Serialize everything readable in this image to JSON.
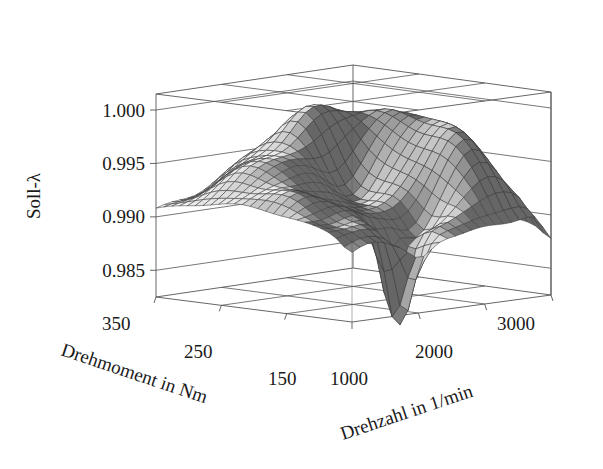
{
  "figure": {
    "background_color": "#ffffff",
    "line_color": "#555555",
    "text_color": "#1a1a1a"
  },
  "chart_data": {
    "type": "surface",
    "title": "",
    "projection": "3d-wireframe-surface",
    "shading": "grayscale-mesh",
    "grid": true,
    "legend": null,
    "zlabel": "Soll-λ",
    "xlabel": "Drehmoment in Nm",
    "ylabel": "Drehzahl in 1/min",
    "zticks": [
      "1.000",
      "0.995",
      "0.990",
      "0.985"
    ],
    "ztick_values": [
      1.0,
      0.995,
      0.99,
      0.985
    ],
    "zlim": [
      0.9825,
      1.0015
    ],
    "xticks": [
      "350",
      "250",
      "150"
    ],
    "xtick_values": [
      350,
      250,
      150
    ],
    "xlim": [
      100,
      400
    ],
    "yticks": [
      "1000",
      "2000",
      "3000"
    ],
    "ytick_values": [
      1000,
      2000,
      3000
    ],
    "ylim": [
      700,
      3300
    ],
    "surface_summary": "Soll-lambda map over engine torque and speed; broad plateau near 0.990-0.993 with raised ridges approaching 0.998-1.000 at mid/high speed and a deep narrow notch dropping below 0.983 near 1500 1/min at low torque.",
    "z_min": 0.9822,
    "z_max": 1.0,
    "nx": 26,
    "ny": 26
  },
  "axis_labels": {
    "z": "Soll-λ",
    "x": "Drehmoment in Nm",
    "y": "Drehzahl in 1/min"
  },
  "z_ticks": [
    {
      "label": "1.000",
      "value": 1.0
    },
    {
      "label": "0.995",
      "value": 0.995
    },
    {
      "label": "0.990",
      "value": 0.99
    },
    {
      "label": "0.985",
      "value": 0.985
    }
  ],
  "x_ticks": [
    {
      "label": "350",
      "value": 350
    },
    {
      "label": "250",
      "value": 250
    },
    {
      "label": "150",
      "value": 150
    }
  ],
  "y_ticks": [
    {
      "label": "1000",
      "value": 1000
    },
    {
      "label": "2000",
      "value": 2000
    },
    {
      "label": "3000",
      "value": 3000
    }
  ]
}
